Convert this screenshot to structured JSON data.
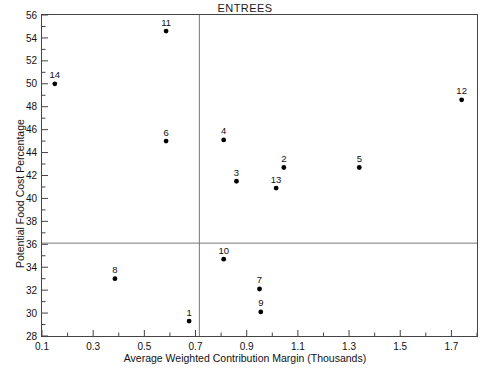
{
  "chart_data": {
    "type": "scatter",
    "title": "ENTREES",
    "xlabel": "Average Weighted Contribution Margin (Thousands)",
    "ylabel": "Potential Food Cost Percentage",
    "xlim": [
      0.1,
      1.8
    ],
    "ylim": [
      28,
      56
    ],
    "grid": false,
    "legend": "none",
    "x_ticks_major": [
      0.1,
      0.3,
      0.5,
      0.7,
      0.9,
      1.1,
      1.3,
      1.5,
      1.7
    ],
    "x_tick_labels": [
      "0.1",
      "0.3",
      "0.5",
      "0.7",
      "0.9",
      "1.1",
      "1.3",
      "1.5",
      "1.7"
    ],
    "x_ticks_minor": [
      0.2,
      0.4,
      0.6,
      0.8,
      1.0,
      1.2,
      1.4,
      1.6,
      1.8
    ],
    "y_ticks_major": [
      28,
      30,
      32,
      34,
      36,
      38,
      40,
      42,
      44,
      46,
      48,
      50,
      52,
      54,
      56
    ],
    "y_tick_labels": [
      "28",
      "30",
      "32",
      "34",
      "36",
      "38",
      "40",
      "42",
      "44",
      "46",
      "48",
      "50",
      "52",
      "54",
      "56"
    ],
    "y_ticks_minor": [
      29,
      31,
      33,
      35,
      37,
      39,
      41,
      43,
      45,
      47,
      49,
      51,
      53,
      55
    ],
    "reference_lines": {
      "horizontal_y": 36.1,
      "vertical_x": 0.715
    },
    "points": [
      {
        "label": "1",
        "x": 0.675,
        "y": 29.3
      },
      {
        "label": "2",
        "x": 1.045,
        "y": 42.7
      },
      {
        "label": "3",
        "x": 0.86,
        "y": 41.5
      },
      {
        "label": "4",
        "x": 0.81,
        "y": 45.1
      },
      {
        "label": "5",
        "x": 1.34,
        "y": 42.7
      },
      {
        "label": "6",
        "x": 0.585,
        "y": 45.0
      },
      {
        "label": "7",
        "x": 0.95,
        "y": 32.1
      },
      {
        "label": "8",
        "x": 0.385,
        "y": 33.0
      },
      {
        "label": "9",
        "x": 0.955,
        "y": 30.1
      },
      {
        "label": "10",
        "x": 0.81,
        "y": 34.7
      },
      {
        "label": "11",
        "x": 0.585,
        "y": 54.6
      },
      {
        "label": "12",
        "x": 1.74,
        "y": 48.6
      },
      {
        "label": "13",
        "x": 1.015,
        "y": 40.9
      },
      {
        "label": "14",
        "x": 0.15,
        "y": 50.0
      }
    ]
  },
  "colors": {
    "point": "#000000",
    "frame": "#444444",
    "reference_line": "#777777",
    "text": "#111111"
  }
}
